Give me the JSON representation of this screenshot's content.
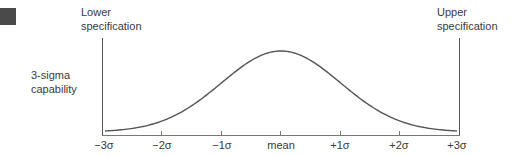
{
  "labels": {
    "lower_spec_line1": "Lower",
    "lower_spec_line2": "specification",
    "upper_spec_line1": "Upper",
    "upper_spec_line2": "specification",
    "capability_line1": "3-sigma",
    "capability_line2": "capability"
  },
  "axis": {
    "ticks": [
      "−3σ",
      "−2σ",
      "−1σ",
      "mean",
      "+1σ",
      "+2σ",
      "+3σ"
    ]
  },
  "colors": {
    "line": "#555555",
    "text": "#3a3a3a"
  }
}
